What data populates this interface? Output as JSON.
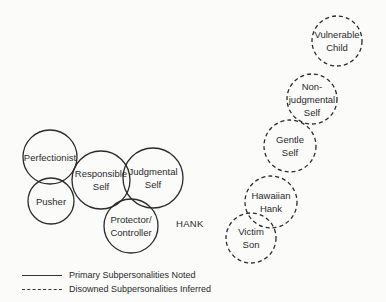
{
  "diagram": {
    "title": "HANK",
    "primary": [
      {
        "id": "perfectionist",
        "label": "Perfectionist",
        "cx": 50,
        "cy": 157,
        "r": 27
      },
      {
        "id": "pusher",
        "label": "Pusher",
        "cx": 51,
        "cy": 201,
        "r": 23
      },
      {
        "id": "responsible-self",
        "label": "Responsible\nSelf",
        "cx": 101,
        "cy": 180,
        "r": 29
      },
      {
        "id": "judgmental-self",
        "label": "Judgmental\nSelf",
        "cx": 153,
        "cy": 178,
        "r": 30
      },
      {
        "id": "protector-controller",
        "label": "Protector/\nController",
        "cx": 131,
        "cy": 226,
        "r": 27
      }
    ],
    "disowned": [
      {
        "id": "vulnerable-child",
        "label": "Vulnerable\nChild",
        "cx": 337,
        "cy": 41,
        "r": 25
      },
      {
        "id": "non-judgmental-self",
        "label": "Non-\njudgmental\nSelf",
        "cx": 312,
        "cy": 99,
        "r": 25
      },
      {
        "id": "gentle-self",
        "label": "Gentle\nSelf",
        "cx": 290,
        "cy": 146,
        "r": 26
      },
      {
        "id": "hawaiian-hank",
        "label": "Hawaiian\nHank",
        "cx": 271,
        "cy": 202,
        "r": 26
      },
      {
        "id": "victim-son",
        "label": "Victim\nSon",
        "cx": 251,
        "cy": 238,
        "r": 25
      }
    ],
    "hank_label": {
      "text": "HANK",
      "x": 176,
      "y": 218
    }
  },
  "legend": {
    "primary_label": "Primary Subpersonalities Noted",
    "disowned_label": "Disowned Subpersonalities Inferred"
  }
}
